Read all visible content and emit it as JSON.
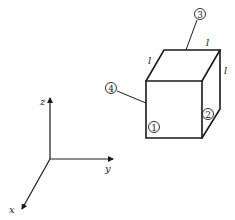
{
  "figure": {
    "axes": {
      "x_label": "x",
      "y_label": "y",
      "z_label": "z"
    },
    "cube": {
      "edge_labels": [
        "l",
        "l",
        "l"
      ],
      "face_labels": {
        "face_1": "1",
        "face_2": "2",
        "face_3": "3",
        "face_4": "4"
      }
    },
    "colors": {
      "stroke": "#1a1a1a",
      "background": "#ffffff"
    }
  }
}
